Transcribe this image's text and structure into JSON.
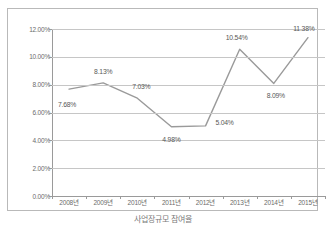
{
  "chart_data": {
    "type": "line",
    "title": "",
    "subtitle": "",
    "xlabel": "",
    "ylabel": "",
    "categories": [
      "2008년",
      "2009년",
      "2010년",
      "2011년",
      "2012년",
      "2013년",
      "2014년",
      "2015년"
    ],
    "values": [
      7.68,
      8.13,
      7.03,
      4.98,
      5.04,
      10.54,
      8.09,
      11.38
    ],
    "point_labels": [
      "7.68%",
      "8.13%",
      "7.03%",
      "4.98%",
      "5.04%",
      "10.54%",
      "8.09%",
      "11.38%"
    ],
    "ylim": [
      0.0,
      12.0
    ],
    "ytick_values": [
      0.0,
      2.0,
      4.0,
      6.0,
      8.0,
      10.0,
      12.0
    ],
    "ytick_labels": [
      "0.00%",
      "2.00%",
      "4.00%",
      "6.00%",
      "8.00%",
      "10.00%",
      "12.00%"
    ],
    "grid": true,
    "legend": false,
    "legend_position": "none",
    "series_color": "#9a9a9a",
    "grid_color": "#c6c6c6",
    "axis_color": "#9a9a9a",
    "border_color": "#b9b9b9",
    "label_color": "#6b6b6b"
  },
  "caption": {
    "text": "사업장규모 참여율"
  }
}
